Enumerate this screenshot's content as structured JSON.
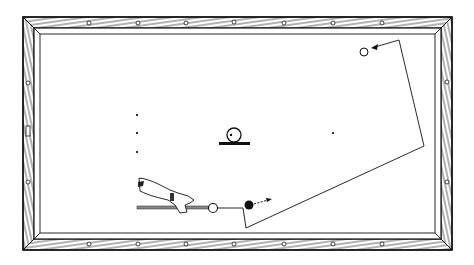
{
  "diagram": {
    "colors": {
      "ink": "#1a1a1a",
      "paper": "#ffffff",
      "wood": "#ffffff"
    },
    "table": {
      "outer": [
        22,
        16,
        452,
        250
      ],
      "inner": [
        40,
        33,
        435,
        232
      ]
    },
    "balls": [
      {
        "id": "cue-ball",
        "cx": 213,
        "cy": 208,
        "r": 4.5,
        "fill": "#ffffff"
      },
      {
        "id": "object-ball-start",
        "cx": 249,
        "cy": 205,
        "r": 4.5,
        "fill": "#111111"
      },
      {
        "id": "target-ball",
        "cx": 364,
        "cy": 52,
        "r": 4,
        "fill": "#ffffff"
      },
      {
        "id": "legend-ball",
        "cx": 234,
        "cy": 135,
        "r": 7,
        "fill": "#ffffff"
      }
    ],
    "path_points": [
      [
        218,
        208
      ],
      [
        243,
        208
      ],
      [
        246,
        228
      ],
      [
        424,
        146
      ],
      [
        399,
        40
      ],
      [
        375,
        47
      ]
    ],
    "spots": [
      [
        137,
        115
      ],
      [
        137,
        133
      ],
      [
        137,
        152
      ],
      [
        333,
        133
      ]
    ]
  }
}
